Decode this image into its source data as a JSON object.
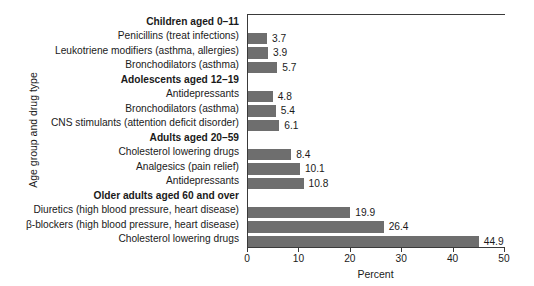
{
  "chart_data": {
    "type": "bar",
    "orientation": "horizontal",
    "title": "",
    "xlabel": "Percent",
    "ylabel": "Age group and drug type",
    "xlim": [
      0,
      50
    ],
    "xticks": [
      0,
      10,
      20,
      30,
      40,
      50
    ],
    "grid": false,
    "legend": null,
    "bar_color": "#6e6e6e",
    "axis_color": "#3a3a3a",
    "categories": [
      "Children aged 0–11",
      "Penicillins (treat infections)",
      "Leukotriene modifiers (asthma, allergies)",
      "Bronchodilators (asthma)",
      "Adolescents aged 12–19",
      "Antidepressants",
      "Bronchodilators (asthma)",
      "CNS stimulants (attention deficit disorder)",
      "Adults aged 20–59",
      "Cholesterol lowering drugs",
      "Analgesics (pain relief)",
      "Antidepressants",
      "Older adults aged 60 and over",
      "Diuretics (high blood pressure, heart disease)",
      "β-blockers (high blood pressure, heart disease)",
      "Cholesterol lowering drugs"
    ],
    "is_group_header": [
      true,
      false,
      false,
      false,
      true,
      false,
      false,
      false,
      true,
      false,
      false,
      false,
      true,
      false,
      false,
      false
    ],
    "values": [
      null,
      3.7,
      3.9,
      5.7,
      null,
      4.8,
      5.4,
      6.1,
      null,
      8.4,
      10.1,
      10.8,
      null,
      19.9,
      26.4,
      44.9
    ],
    "value_labels": [
      "",
      "3.7",
      "3.9",
      "5.7",
      "",
      "4.8",
      "5.4",
      "6.1",
      "",
      "8.4",
      "10.1",
      "10.8",
      "",
      "19.9",
      "26.4",
      "44.9"
    ]
  }
}
